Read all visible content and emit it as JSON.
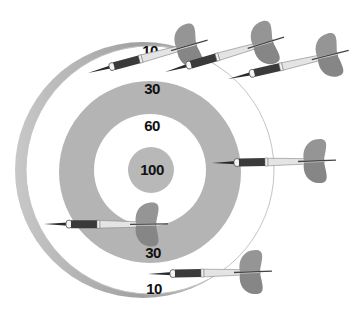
{
  "illustration": {
    "subject": "dartboard with darts",
    "colors": {
      "background": "#ffffff",
      "board_edge": "#a8a8a8",
      "ring": "#b4b4b4",
      "bull": "#b8b8b8",
      "dart_grip": "#3a3a3a",
      "dart_shaft": "#e2e2e2",
      "dart_flight": "#909090"
    },
    "zones": [
      {
        "label": "10",
        "position": "outer-top"
      },
      {
        "label": "30",
        "position": "ring-top"
      },
      {
        "label": "60",
        "position": "inner-white"
      },
      {
        "label": "100",
        "position": "bullseye"
      },
      {
        "label": "30",
        "position": "ring-bottom"
      },
      {
        "label": "10",
        "position": "outer-bottom"
      }
    ],
    "dart_count": 6
  }
}
